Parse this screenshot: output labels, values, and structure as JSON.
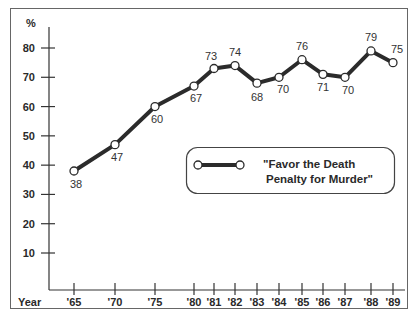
{
  "chart_data": {
    "type": "line",
    "title": "",
    "xlabel": "Year",
    "ylabel": "%",
    "ylim": [
      0,
      85
    ],
    "yticks": [
      10,
      20,
      30,
      40,
      50,
      60,
      70,
      80
    ],
    "ytick_labels": [
      "10",
      "20",
      "30",
      "40",
      "50",
      "60",
      "70",
      "80"
    ],
    "x": [
      "'65",
      "'70",
      "'75",
      "'80",
      "'81",
      "'82",
      "'83",
      "'84",
      "'85",
      "'86",
      "'87",
      "'88",
      "'89"
    ],
    "x_numeric": [
      1965,
      1970,
      1975,
      1980,
      1981,
      1982,
      1983,
      1984,
      1985,
      1986,
      1987,
      1988,
      1989
    ],
    "series": [
      {
        "name": "\"Favor the Death Penalty for Murder\"",
        "values": [
          38,
          47,
          60,
          67,
          73,
          74,
          68,
          70,
          76,
          71,
          70,
          79,
          75
        ]
      }
    ],
    "legend": {
      "position": "center-right",
      "line1": "\"Favor the Death",
      "line2": "Penalty for Murder\""
    },
    "grid": false,
    "colors": {
      "line": "#2b2b2b",
      "marker_fill": "#ffffff",
      "frame": "#555555"
    }
  },
  "axis": {
    "y_unit_label": "%",
    "x_title": "Year"
  }
}
